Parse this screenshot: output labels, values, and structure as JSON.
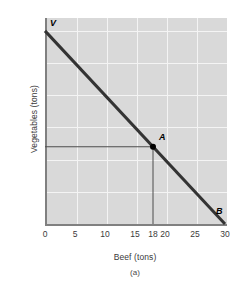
{
  "chart_data": {
    "type": "line",
    "title": "",
    "caption": "(a)",
    "xlabel": "Beef (tons)",
    "ylabel": "Vegetables (tons)",
    "xlim": [
      0,
      30
    ],
    "ylim": [
      0,
      32
    ],
    "grid": true,
    "legend": "none",
    "xticks": [
      {
        "value": 0,
        "label": "0"
      },
      {
        "value": 5,
        "label": "5"
      },
      {
        "value": 10,
        "label": "10"
      },
      {
        "value": 15,
        "label": "15"
      },
      {
        "value": 18,
        "label": "18"
      },
      {
        "value": 20,
        "label": "20"
      },
      {
        "value": 25,
        "label": "25"
      },
      {
        "value": 30,
        "label": "30"
      }
    ],
    "yticks": [
      {
        "value": 5,
        "label": "5"
      },
      {
        "value": 10,
        "label": "10"
      },
      {
        "value": 12,
        "label": "12"
      },
      {
        "value": 15,
        "label": "15"
      },
      {
        "value": 20,
        "label": "20"
      },
      {
        "value": 25,
        "label": "25"
      },
      {
        "value": 30,
        "label": "30"
      }
    ],
    "gridlines": {
      "x": [
        5,
        10,
        15,
        20,
        25
      ],
      "y": [
        5,
        10,
        15,
        20,
        25,
        30
      ]
    },
    "series": [
      {
        "name": "production-possibilities-frontier",
        "type": "line",
        "x": [
          0,
          30
        ],
        "values": [
          30,
          0
        ],
        "color": "#333333",
        "width": 3
      }
    ],
    "annotations": [
      {
        "name": "V",
        "label": "V",
        "x": 0,
        "y": 30,
        "marker": "none",
        "label_dx": 5,
        "label_dy": -12
      },
      {
        "name": "A",
        "label": "A",
        "x": 18,
        "y": 12,
        "marker": "dot",
        "label_dx": 6,
        "label_dy": -14
      },
      {
        "name": "B",
        "label": "B",
        "x": 30,
        "y": 0,
        "marker": "none",
        "label_dx": -9,
        "label_dy": -17
      }
    ],
    "reference_lines": [
      {
        "name": "vegetables-reference-at-12",
        "orientation": "horizontal",
        "value": 12,
        "from": 0,
        "to": 18,
        "color": "#4d4d4d"
      },
      {
        "name": "beef-reference-at-18",
        "orientation": "vertical",
        "value": 18,
        "from": 0,
        "to": 12,
        "color": "#4d4d4d"
      }
    ],
    "colors": {
      "plot_background": "#d9d9d9",
      "gridline": "#f4f4f4",
      "axis": "#808080",
      "line": "#333333",
      "text": "#3a3a3a"
    }
  }
}
